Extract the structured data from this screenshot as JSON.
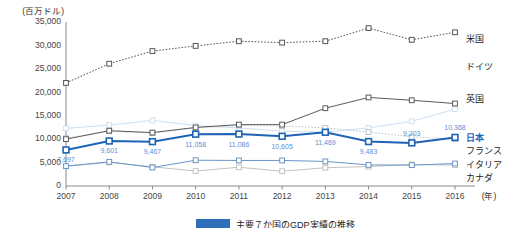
{
  "chart_data": {
    "type": "line",
    "xlabel": "(年)",
    "ylabel": "(百万ドル)",
    "ylim": [
      0,
      35000
    ],
    "ytick_values": [
      0,
      5000,
      10000,
      15000,
      20000,
      25000,
      30000,
      35000
    ],
    "ytick_labels": [
      "0",
      "5,000",
      "10,000",
      "15,000",
      "20,000",
      "25,000",
      "30,000",
      "35,000"
    ],
    "categories": [
      "2007",
      "2008",
      "2009",
      "2010",
      "2011",
      "2012",
      "2013",
      "2014",
      "2015",
      "2016"
    ],
    "grid": false,
    "legend_position": "right",
    "series": [
      {
        "name": "米国",
        "color": "#555555",
        "style": "dotted",
        "width": 1,
        "marker": "square-open",
        "values": [
          22000,
          26100,
          28800,
          29900,
          30900,
          30600,
          30900,
          33700,
          31200,
          32800
        ]
      },
      {
        "name": "ドイツ",
        "color": "#cfe0f0",
        "style": "solid",
        "width": 1,
        "marker": "square-open",
        "values": [
          12300,
          13000,
          14000,
          12900,
          12400,
          11700,
          11500,
          12400,
          13800,
          16400
        ]
      },
      {
        "name": "英国",
        "color": "#5a5a5a",
        "style": "solid",
        "width": 1,
        "marker": "square-open",
        "values": [
          10000,
          11800,
          11400,
          12500,
          13100,
          13100,
          16600,
          18900,
          18300,
          17600
        ]
      },
      {
        "name": "日本",
        "color": "#1f63b5",
        "style": "solid",
        "width": 2,
        "marker": "square-open",
        "values": [
          7697,
          9601,
          9467,
          11058,
          11086,
          10605,
          11469,
          9483,
          9203,
          10368
        ],
        "labels": [
          "7,697",
          "9,601",
          "9,467",
          "11,058",
          "11,086",
          "10,605",
          "11,469",
          "9,483",
          "9,203",
          "10,368"
        ]
      },
      {
        "name": "フランス",
        "color": "#b9c4cf",
        "style": "dotted",
        "width": 1,
        "marker": "square-open",
        "values": [
          10200,
          11700,
          11300,
          12400,
          12900,
          12800,
          12400,
          11500,
          10500,
          10000
        ]
      },
      {
        "name": "イタリア",
        "color": "#6a96c8",
        "style": "solid",
        "width": 1,
        "marker": "square-open",
        "values": [
          4250,
          5150,
          3950,
          5500,
          5450,
          5450,
          5250,
          4500,
          4450,
          4800
        ]
      },
      {
        "name": "カナダ",
        "color": "#c2c2bc",
        "style": "solid",
        "width": 1,
        "marker": "square-open",
        "values": [
          4200,
          5050,
          4100,
          3200,
          4000,
          3150,
          3900,
          4150,
          4600,
          4450
        ]
      }
    ],
    "legend_labels": [
      "米国",
      "ドイツ",
      "英国",
      "日本",
      "フランス",
      "イタリア",
      "カナダ"
    ]
  },
  "caption": {
    "figure_number": "図 14-1",
    "text": "主要７か国のGDP実績の推移"
  }
}
